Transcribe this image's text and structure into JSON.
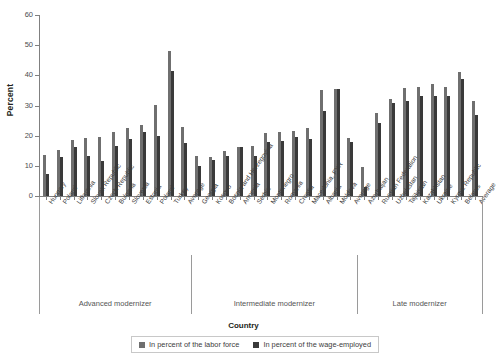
{
  "chart_data": {
    "type": "bar",
    "title": "",
    "xlabel": "Country",
    "ylabel": "Percent",
    "ylim": [
      0,
      60
    ],
    "yticks": [
      0,
      10,
      20,
      30,
      40,
      50,
      60
    ],
    "grid": false,
    "legend_position": "bottom",
    "categories": [
      "Hungary",
      "Poland",
      "Lithuania",
      "Slovak Republic",
      "Czech Republic",
      "Bulgaria",
      "Slovenia",
      "Estonia",
      "Poland",
      "Turkey",
      "Average",
      "Georgia",
      "Kosovo",
      "Bosnia and Herzegovina",
      "Armenia",
      "Serbia",
      "Montenegro",
      "Romania",
      "Croatia",
      "Macedonia, FYR",
      "Albania",
      "Moldova",
      "Average",
      "Azerbaijan",
      "Russian Federation",
      "Uzbekistan",
      "Tajikistan",
      "Kazakhstan",
      "Ukraine",
      "Kyrgyz Republic",
      "Belarus",
      "Average"
    ],
    "series": [
      {
        "name": "In percent of the labor force",
        "color": "#6f6f6f",
        "values": [
          13.5,
          15.3,
          18.5,
          19.3,
          19.6,
          21.3,
          22.7,
          23.4,
          30.2,
          48.0,
          22.9,
          13.1,
          12.8,
          14.9,
          16.3,
          16.7,
          21.0,
          21.2,
          21.4,
          22.6,
          35.2,
          35.6,
          19.2,
          9.5,
          27.4,
          32.0,
          35.8,
          36.2,
          37.0,
          36.2,
          41.2,
          31.6
        ]
      },
      {
        "name": "In percent of the wage-employed",
        "color": "#3a3a3a",
        "values": [
          7.3,
          12.9,
          16.2,
          13.3,
          11.5,
          16.5,
          18.9,
          21.2,
          19.8,
          41.5,
          17.6,
          10.0,
          12.1,
          13.2,
          16.2,
          13.3,
          17.8,
          18.1,
          19.4,
          18.8,
          28.2,
          35.5,
          17.8,
          3.1,
          24.2,
          30.7,
          31.5,
          33.1,
          33.1,
          33.3,
          38.9,
          26.8
        ]
      }
    ],
    "groups": [
      {
        "label": "Advanced modernizer",
        "start": 0,
        "end": 10
      },
      {
        "label": "Intermediate modernizer",
        "start": 11,
        "end": 22
      },
      {
        "label": "Late modernizer",
        "start": 23,
        "end": 31
      }
    ]
  },
  "legend": {
    "items": [
      {
        "label": "In percent of the labor force"
      },
      {
        "label": "In percent of the wage-employed"
      }
    ]
  }
}
